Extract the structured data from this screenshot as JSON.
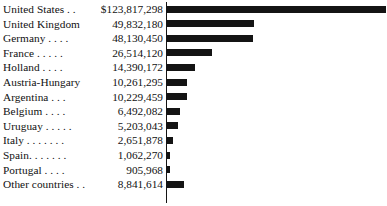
{
  "chart_data": {
    "type": "bar",
    "title": "",
    "subtitle": "",
    "xlabel": "",
    "ylabel": "",
    "orientation": "horizontal",
    "grid": false,
    "legend": null,
    "axis_line": "left vertical rule at bar origin",
    "value_prefix_first_row": "$",
    "categories": [
      "United States . .",
      "United Kingdom",
      "Germany . . . .",
      "France . . . . .",
      "Holland  . . . .",
      "Austria-Hungary",
      "Argentina  . . .",
      "Belgium  . . . .",
      "Uruguay . . . . .",
      "Italy . . . . . . .",
      "Spain. . . . . . .",
      "Portugal  . . . .",
      "Other countries . ."
    ],
    "category_names": [
      "United States",
      "United Kingdom",
      "Germany",
      "France",
      "Holland",
      "Austria-Hungary",
      "Argentina",
      "Belgium",
      "Uruguay",
      "Italy",
      "Spain",
      "Portugal",
      "Other countries"
    ],
    "values": [
      123817298,
      49832180,
      48130450,
      26514120,
      14390172,
      10261295,
      10229459,
      6492082,
      5203043,
      2651878,
      1062270,
      905968,
      8841614
    ],
    "value_labels": [
      "$123,817,298",
      "49,832,180",
      "48,130,450",
      "26,514,120",
      "14,390,172",
      "10,261,295",
      "10,229,459",
      "6,492,082",
      "5,203,043",
      "2,651,878",
      "1,062,270",
      "905,968",
      "8,841,614"
    ],
    "xlim": [
      0,
      123817298
    ],
    "bar_color": "#141414",
    "background_color": "#ffffff"
  },
  "rows": [
    {
      "label": "United States . .",
      "value": "$123,817,298",
      "bar_px": 219
    },
    {
      "label": "United Kingdom",
      "value": "49,832,180",
      "bar_px": 87
    },
    {
      "label": "Germany . . . .",
      "value": "48,130,450",
      "bar_px": 86
    },
    {
      "label": "France . . . . .",
      "value": "26,514,120",
      "bar_px": 45
    },
    {
      "label": "Holland  . . . .",
      "value": "14,390,172",
      "bar_px": 28
    },
    {
      "label": "Austria-Hungary",
      "value": "10,261,295",
      "bar_px": 20
    },
    {
      "label": "Argentina  . . .",
      "value": "10,229,459",
      "bar_px": 20
    },
    {
      "label": "Belgium  . . . .",
      "value": "6,492,082",
      "bar_px": 13
    },
    {
      "label": "Uruguay . . . . .",
      "value": "5,203,043",
      "bar_px": 11
    },
    {
      "label": "Italy . . . . . . .",
      "value": "2,651,878",
      "bar_px": 6
    },
    {
      "label": "Spain. . . . . . .",
      "value": "1,062,270",
      "bar_px": 3
    },
    {
      "label": "Portugal  . . . .",
      "value": "905,968",
      "bar_px": 3
    },
    {
      "label": "Other countries . .",
      "value": "8,841,614",
      "bar_px": 17
    }
  ]
}
